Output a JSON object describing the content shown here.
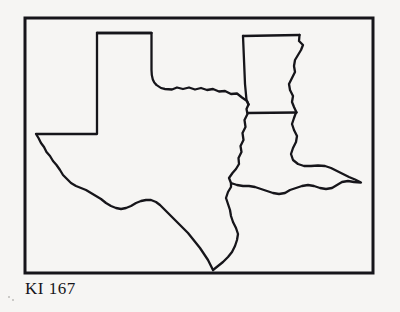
{
  "figure": {
    "caption": "KI 167",
    "background_color": "#f6f5f3",
    "ink_color": "#16151a",
    "frame": {
      "name": "figure-border",
      "x": 25,
      "y": 18,
      "width": 348,
      "height": 255,
      "stroke_width": 3
    },
    "map": {
      "name": "us-south-central-states-outline",
      "description": "Line-art outline map of the south-central United States showing Texas, Oklahoma, Arkansas and Louisiana with state boundaries and the Gulf coast.",
      "stroke_width": 2.3,
      "fill": "none",
      "regions": [
        {
          "name": "texas",
          "label": "Texas",
          "path": "M 97 33 L 151.5 33 L 151.5 70 Q 151.5 80 156 84 Q 160 88 164 88.5 L 176 89.5 L 182 87.5 L 189 88.5 L 196 87 L 202 89.5 L 209 88.5 L 215 91.5 L 222 91 L 228 94 L 234 93.5 L 240 97 L 246 100 L 248 103.5 L 246 109 L 247 113 L 244 119 L 245 126 L 242 132 L 243 139 L 240 145 L 241 151 L 238 157 L 239 163 L 236 168 L 233 172 L 230 178 L 231 184 L 228 191 L 229 198 L 226 205 L 223 212 L 221 220 L 218 228 L 215 237 L 213 245 L 211 253 L 212 262 L 213 269.5 L 209 264 L 205 257 L 200 251 L 195 246 L 189 241 L 183 237 L 177 233 L 171 230 L 166 226 L 161 221 L 157 215 L 154 209 L 150 204 L 147 198 L 144 193 L 141 188 L 137 184 L 133 181 L 128 179 L 123 177 L 118 174 L 114 170 L 110 165 L 107 160 L 103 155 L 99 151 L 95 147 L 91 143 L 87 139 L 83 135 L 79 131 L 75 128 L 71 125 L 67 122 L 63 120 L 58 119 L 53 119 L 48 120 L 43 122 L 39 126 L 36 131 L 36 134 L 97 134 Z"
        },
        {
          "name": "oklahoma",
          "label": "Oklahoma",
          "path": "M 97 33 L 151.5 33 L 151.5 70 Q 151.5 80 156 84 Q 160 88 164 88.5 L 176 89.5 L 182 87.5 L 189 88.5 L 196 87 L 202 89.5 L 209 88.5 L 215 91.5 L 222 91 L 228 94 L 234 93.5 L 240 97 L 246 100 L 248 103.5 L 243 36 L 97 33 Z"
        },
        {
          "name": "arkansas",
          "label": "Arkansas",
          "path": "M 243 36 L 300 35 L 299 42 L 303 46 L 300 52 L 297 58 L 294 64 L 295 71 L 292 77 L 289 83 L 291 90 L 294 96 L 293 103 L 296 109 L 296 112 L 247 113 L 246 109 L 248 103.5 L 243 36 Z"
        },
        {
          "name": "louisiana",
          "label": "Louisiana",
          "path": "M 247 113 L 296 112 L 294 118 L 292 124 L 294 130 L 297 136 L 296 142 L 293 148 L 290 154 L 292 160 L 297 164 L 303 166 L 310 166 L 317 165 L 324 166 L 331 169 L 337 173 L 343 176 L 350 178 L 357 180 L 362 182 L 356 182 L 350 181 L 344 182 L 339 185 L 334 188 L 328 189 L 322 188 L 316 186 L 310 185 L 304 186 L 298 188 L 292 190 L 287 193 L 281 194 L 275 193 L 269 191 L 263 189 L 257 187 L 251 186 L 245 186 L 239 186 L 233 185 L 228 183 L 234 178 L 238 172 L 241 166 L 239 160 L 236 154 L 238 148 L 241 142 L 243 136 L 245 130 L 244 124 L 245 119 L 247 113 Z"
        }
      ],
      "borders": [
        {
          "name": "texas-outline",
          "path": "M 97 33 L 151.5 33 L 151.5 70 Q 151.5 81 156.5 85 Q 160.5 88.5 165 89 L 172 89.5 L 177 87.5 L 183 89 L 189 87.5 L 195 89.5 L 201 88 L 207 90 L 213 89 L 219 91.5 L 225 91 L 231 94 L 237 93.5 L 242 97.5 L 247 101 L 248.5 104.5"
        },
        {
          "name": "texas-west-and-gulf",
          "path": "M 97 33 L 97 134 L 36 134 L 38.5 138 L 41 143 L 44 147 L 46.5 152 L 50 156 L 53 161 L 56.5 165 L 60 170 L 63 175 L 67 179 L 71 183 L 76 186 L 81 188 L 86 190 L 91 193 L 96 196 L 101 199 L 106 203 L 111 206 L 116 208 L 121 209 L 126 208 L 131 206 L 136 203 L 141 201 L 146 200 L 151 200 L 156 202 L 160 205 L 164 209 L 168 213 L 172 217 L 176 221 L 180 225 L 184 229 L 188 233 L 192 238 L 196 243 L 200 248 L 204 254 L 208 260 L 211 266 L 213 270"
        },
        {
          "name": "texas-louisiana-and-sabine",
          "path": "M 248.5 104.5 L 246.5 109 L 247.5 114 L 244.5 120 L 245.5 127 L 242.5 133 L 243.5 140 L 240.5 146 L 241.5 152 L 238.5 158 L 239 164 L 236 169 L 232.5 173 L 229 178 L 231 183"
        },
        {
          "name": "gulf-coast-louisiana",
          "path": "M 213 270 L 218 266 L 223 262 L 228 257 L 232 252 L 235 246 L 237 240 L 238 234 L 236 228 L 233 222 L 231 216 L 230 210 L 228 204 L 226 198 L 228 192 L 231 187 L 231 183 L 237 185 L 243 186 L 249 186 L 255 187 L 261 189 L 267 191 L 273 193 L 279 194 L 285 193 L 290 190 L 296 188 L 302 186 L 308 185 L 314 186 L 320 188 L 326 189 L 332 188 L 337 185 L 342 182 L 348 181 L 354 182 L 361 182.5 L 355 179.5 L 349 177 L 343 174 L 337 171 L 331 168 L 325 166 L 318 165.5 L 311 166 L 304 166 L 298 164 L 293 160 L 291 154 L 293 148 L 296 142 L 297 136 L 294 130 L 292 124 L 294 118 L 296 112.5"
        },
        {
          "name": "arkansas-louisiana-border",
          "path": "M 247.5 113 L 296.5 112.5"
        },
        {
          "name": "oklahoma-arkansas-border",
          "path": "M 243 36 L 244 60 L 245 84 L 246.5 100 L 248.5 104.5"
        },
        {
          "name": "oklahoma-arkansas-north-border",
          "path": "M 243 36 L 270 35.5 L 299.5 35"
        },
        {
          "name": "mississippi-river-border",
          "path": "M 299.5 35 L 299 41 L 303 45 L 301 50 L 298 55 L 295 60 L 294 66 L 295 72 L 292 78 L 289 84 L 290 90 L 293 96 L 292 102 L 294 107 L 296.5 112.5"
        },
        {
          "name": "oklahoma-panhandle-north",
          "path": "M 97 33 L 151.5 33"
        }
      ]
    }
  }
}
